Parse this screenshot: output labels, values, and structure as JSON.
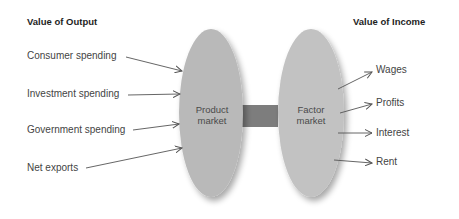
{
  "headers": {
    "output": "Value of Output",
    "income": "Value of Income"
  },
  "product_market": {
    "line1": "Product",
    "line2": "market",
    "fill": "#b9b9b9"
  },
  "factor_market": {
    "line1": "Factor",
    "line2": "market",
    "fill": "#c2c2c2"
  },
  "connector": {
    "fill": "#7d7d7d"
  },
  "inputs": [
    {
      "label": "Consumer spending"
    },
    {
      "label": "Investment spending"
    },
    {
      "label": "Government spending"
    },
    {
      "label": "Net exports"
    }
  ],
  "outputs": [
    {
      "label": "Wages"
    },
    {
      "label": "Profits"
    },
    {
      "label": "Interest"
    },
    {
      "label": "Rent"
    }
  ]
}
